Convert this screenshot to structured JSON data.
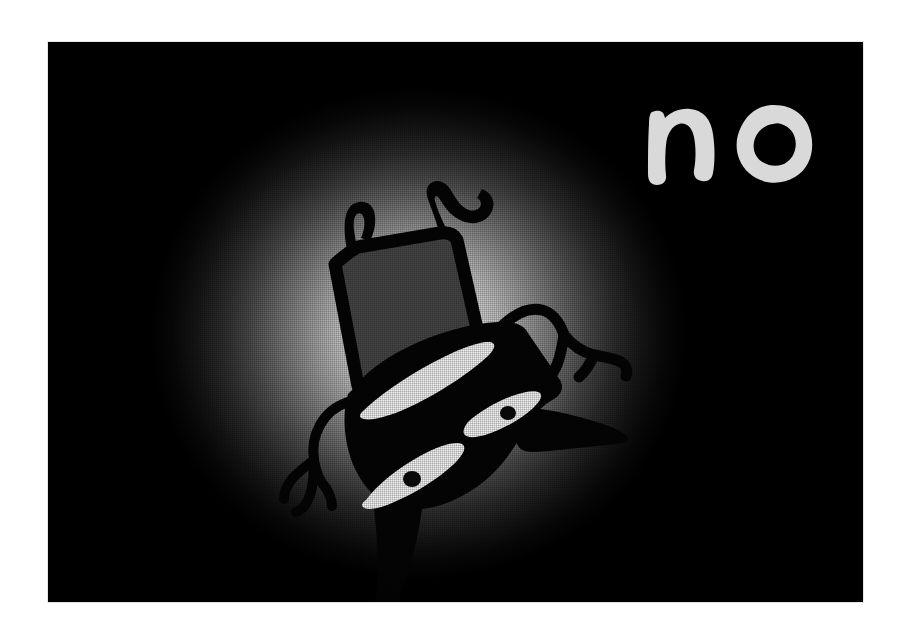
{
  "artwork": {
    "title": "no",
    "lettering": {
      "text": "no",
      "style": "hand-painted lowercase",
      "color": "#d9d9d9",
      "position": "upper-right"
    },
    "panel": {
      "background_color": "#030303",
      "page_background_color": "#ffffff",
      "x": 48,
      "y": 42,
      "width": 815,
      "height": 560
    },
    "glow": {
      "type": "radial-spotlight",
      "center_color": "#f4f4f4",
      "edge_color": "#000000",
      "center_x_pct": 45.5,
      "center_y_pct": 52
    },
    "texture": {
      "name": "woven-canvas-texture",
      "description": "fine linen weave visible across the illuminated area"
    },
    "figure": {
      "name": "creature",
      "description": "stylised black silhouette creature with a tall grey hat, two antennae, three white leaf-shaped eyes with dark pupils, branching twig-like arms and a long tail",
      "body_color": "#040404",
      "hat_color": "#464646",
      "eye_color": "#f2f2f2",
      "pupil_color": "#0a0a0a",
      "parts": [
        {
          "name": "left-antenna",
          "label": "left antenna"
        },
        {
          "name": "right-antenna",
          "label": "right antenna"
        },
        {
          "name": "hat",
          "label": "tall grey hat"
        },
        {
          "name": "body",
          "label": "body"
        },
        {
          "name": "eye-upper",
          "label": "upper eye"
        },
        {
          "name": "eye-right",
          "label": "right eye"
        },
        {
          "name": "eye-lower",
          "label": "lower eye"
        },
        {
          "name": "snout",
          "label": "snout"
        },
        {
          "name": "right-arm",
          "label": "right branching arm"
        },
        {
          "name": "left-arm",
          "label": "left branching arm"
        },
        {
          "name": "tail",
          "label": "tail"
        }
      ]
    }
  }
}
